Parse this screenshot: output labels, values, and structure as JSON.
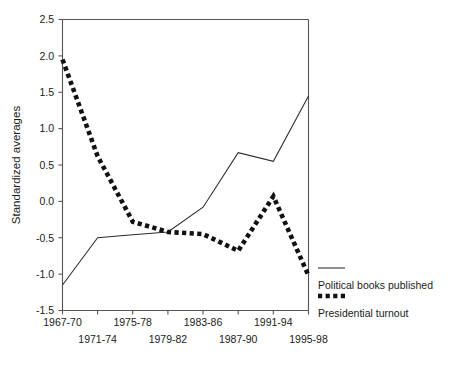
{
  "chart_data": {
    "type": "line",
    "title": "",
    "xlabel": "",
    "ylabel": "Standardized averages",
    "categories": [
      "1967-70",
      "1971-74",
      "1975-78",
      "1979-82",
      "1983-86",
      "1987-90",
      "1991-94",
      "1995-98"
    ],
    "ylim": [
      -1.5,
      2.5
    ],
    "ytick_labels": [
      "2.5",
      "2.0",
      "1.5",
      "1.0",
      "0.5",
      "0.0",
      "-0.5",
      "-1.0",
      "-1.5"
    ],
    "ytick_values": [
      2.5,
      2.0,
      1.5,
      1.0,
      0.5,
      0.0,
      -0.5,
      -1.0,
      -1.5
    ],
    "grid": false,
    "legend_position": "right",
    "series": [
      {
        "name": "Political books published",
        "style": "solid",
        "color": "#2b2b2b",
        "values": [
          -1.15,
          -0.5,
          -0.46,
          -0.42,
          -0.08,
          0.67,
          0.55,
          1.45
        ]
      },
      {
        "name": "Presidential turnout",
        "style": "dotted",
        "color": "#111111",
        "values": [
          1.95,
          0.62,
          -0.28,
          -0.42,
          -0.45,
          -0.68,
          0.07,
          -1.02
        ]
      }
    ]
  },
  "legend": {
    "items": [
      {
        "label": "Political books published",
        "style": "solid"
      },
      {
        "label": "Presidential turnout",
        "style": "dotted"
      }
    ]
  },
  "axes": {
    "y_title": "Standardized averages"
  }
}
